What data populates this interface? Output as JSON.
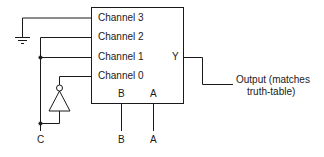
{
  "diagram": {
    "type": "multiplexer-circuit",
    "mux": {
      "inputs": [
        {
          "label": "Channel 3",
          "connection": "ground"
        },
        {
          "label": "Channel 2",
          "connection": "C"
        },
        {
          "label": "Channel 1",
          "connection": "C"
        },
        {
          "label": "Channel 0",
          "connection": "NOT C"
        }
      ],
      "output_label": "Y",
      "select_labels": {
        "b": "B",
        "a": "A"
      }
    },
    "external_labels": {
      "c": "C",
      "b": "B",
      "a": "A"
    },
    "output_note": {
      "line1": "Output (matches",
      "line2": "truth-table)"
    },
    "colors": {
      "line": "#1a1a1a",
      "background": "#ffffff"
    }
  }
}
